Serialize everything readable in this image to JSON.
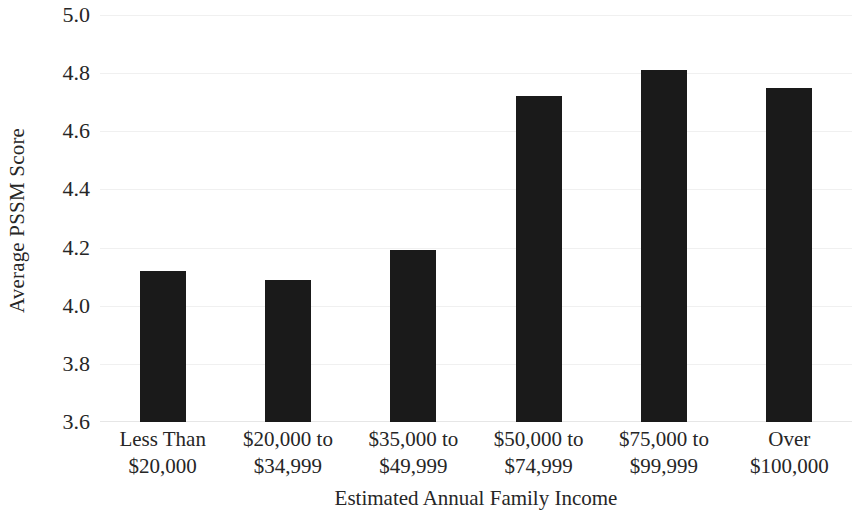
{
  "chart_data": {
    "type": "bar",
    "title": "",
    "subtitle": "",
    "xlabel": "Estimated Annual Family Income",
    "ylabel": "Average PSSM Score",
    "categories": [
      "Less Than $20,000",
      "$20,000 to $34,999",
      "$35,000 to $49,999",
      "$50,000 to $74,999",
      "$75,000 to $99,999",
      "Over $100,000"
    ],
    "category_lines": [
      [
        "Less Than",
        "$20,000"
      ],
      [
        "$20,000 to",
        "$34,999"
      ],
      [
        "$35,000 to",
        "$49,999"
      ],
      [
        "$50,000 to",
        "$74,999"
      ],
      [
        "$75,000 to",
        "$99,999"
      ],
      [
        "Over",
        "$100,000"
      ]
    ],
    "values": [
      4.12,
      4.09,
      4.19,
      4.72,
      4.81,
      4.75
    ],
    "ylim": [
      3.6,
      5.0
    ],
    "ytick_values": [
      5.0,
      4.8,
      4.6,
      4.4,
      4.2,
      4.0,
      3.8,
      3.6
    ],
    "ytick_labels": [
      "5.0",
      "4.8",
      "4.6",
      "4.4",
      "4.2",
      "4.0",
      "3.8",
      "3.6"
    ],
    "ytick_interval": 0.2,
    "grid": "horizontal-major-faint",
    "legend": "none",
    "bar_color": "#1a1a1a",
    "gridline_color": "#f0f0f0",
    "background_color": "#ffffff",
    "text_color": "#262626"
  }
}
